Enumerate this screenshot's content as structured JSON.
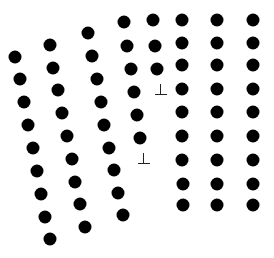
{
  "diagram": {
    "type": "crystal-lattice-grain-boundary",
    "atom_color": "#000000",
    "background": "#ffffff",
    "atom_diameter": 13,
    "grains": [
      {
        "name": "left-grain-tilted",
        "columns": [
          [
            [
              15,
              57
            ],
            [
              20,
              79
            ],
            [
              24,
              102
            ],
            [
              28,
              125
            ],
            [
              33,
              148
            ],
            [
              37,
              171
            ],
            [
              41,
              194
            ],
            [
              45,
              217
            ],
            [
              50,
              239
            ]
          ],
          [
            [
              50,
              45
            ],
            [
              53,
              68
            ],
            [
              58,
              90
            ],
            [
              62,
              113
            ],
            [
              67,
              136
            ],
            [
              72,
              159
            ],
            [
              75,
              182
            ],
            [
              80,
              204
            ],
            [
              85,
              227
            ]
          ],
          [
            [
              88,
              33
            ],
            [
              92,
              56
            ],
            [
              97,
              79
            ],
            [
              101,
              102
            ],
            [
              104,
              125
            ],
            [
              109,
              148
            ],
            [
              114,
              170
            ],
            [
              118,
              193
            ],
            [
              123,
              215
            ]
          ],
          [
            [
              124,
              22
            ],
            [
              127,
              46
            ],
            [
              131,
              69
            ],
            [
              134,
              92
            ],
            [
              137,
              115
            ],
            [
              140,
              138
            ]
          ]
        ]
      },
      {
        "name": "right-grain-square",
        "columns": [
          [
            [
              153,
              20
            ],
            [
              155,
              46
            ],
            [
              157,
              69
            ]
          ],
          [
            [
              182,
              20
            ],
            [
              182,
              43
            ],
            [
              182,
              65
            ],
            [
              182,
              89
            ],
            [
              182,
              112
            ],
            [
              182,
              136
            ],
            [
              182,
              160
            ],
            [
              183,
              184
            ],
            [
              183,
              205
            ]
          ],
          [
            [
              217,
              20
            ],
            [
              217,
              43
            ],
            [
              217,
              65
            ],
            [
              217,
              89
            ],
            [
              217,
              112
            ],
            [
              217,
              136
            ],
            [
              217,
              160
            ],
            [
              217,
              184
            ],
            [
              217,
              205
            ]
          ],
          [
            [
              253,
              20
            ],
            [
              253,
              43
            ],
            [
              253,
              65
            ],
            [
              253,
              89
            ],
            [
              253,
              112
            ],
            [
              253,
              136
            ],
            [
              253,
              160
            ],
            [
              253,
              184
            ],
            [
              253,
              205
            ]
          ]
        ]
      }
    ],
    "dislocations": [
      {
        "symbol": "⊥",
        "x": 161,
        "y": 90
      },
      {
        "symbol": "⊥",
        "x": 144,
        "y": 159
      }
    ]
  }
}
